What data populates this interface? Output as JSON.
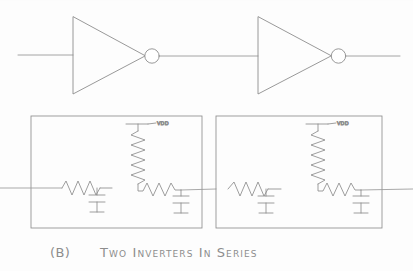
{
  "figure": {
    "caption_label": "(B)",
    "caption_text": "Two Inverters In Series",
    "top_row": {
      "name": "inverter-chain",
      "gates": [
        {
          "label": "inverter-1",
          "bubble": "inverting-bubble"
        },
        {
          "label": "inverter-2",
          "bubble": "inverting-bubble"
        }
      ],
      "input_wire": "input-wire",
      "interconnect_wire": "interconnect-wire",
      "output_wire": "output-wire"
    },
    "models": {
      "name": "rc-equivalent-models",
      "boxes": [
        {
          "name": "rc-model-box-1",
          "supply_label": "VDD",
          "elements": [
            "series-resistor",
            "shunt-capacitor",
            "pullup-resistor",
            "driver-resistor",
            "load-capacitor"
          ]
        },
        {
          "name": "rc-model-box-2",
          "supply_label": "VDD",
          "elements": [
            "series-resistor",
            "shunt-capacitor",
            "pullup-resistor",
            "driver-resistor",
            "load-capacitor"
          ]
        }
      ]
    },
    "colors": {
      "ink": "#8a8a8a",
      "ink_dark": "#6f6f6f",
      "background": "#fdfdfd"
    }
  }
}
